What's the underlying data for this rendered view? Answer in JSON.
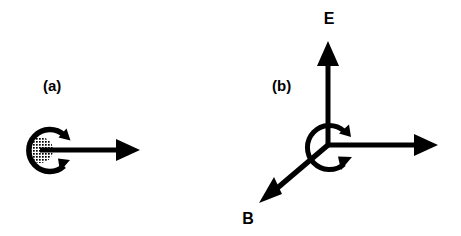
{
  "figure": {
    "background_color": "#ffffff",
    "stroke_color": "#000000",
    "width": 461,
    "height": 236
  },
  "panels": [
    {
      "id": "a",
      "label": "(a)",
      "label_x": 43,
      "label_y": 91,
      "description": "stippled sphere with spin rotation arrow and horizontal vector",
      "sphere": {
        "cx": 40,
        "cy": 150,
        "r": 13,
        "fill_pattern": "halftone-dots"
      },
      "rotation_arrow": {
        "cx": 48,
        "cy": 150,
        "r": 21,
        "opening": "right",
        "arrowheads": 2
      },
      "vector": {
        "label": "",
        "x1": 40,
        "y1": 150,
        "x2": 140,
        "y2": 150,
        "direction": "right"
      }
    },
    {
      "id": "b",
      "label": "(b)",
      "label_x": 272,
      "label_y": 91,
      "description": "three-axis vector triad with rotation arrow at origin",
      "origin_x": 328,
      "origin_y": 145,
      "rotation_arrow": {
        "cx": 322,
        "cy": 147,
        "r": 22,
        "opening": "right",
        "arrowheads": 2
      },
      "vectors": [
        {
          "label": "E",
          "label_x": 329,
          "label_y": 24,
          "x1": 328,
          "y1": 145,
          "x2": 328,
          "y2": 42,
          "direction": "up"
        },
        {
          "label": "",
          "label_x": 0,
          "label_y": 0,
          "x1": 328,
          "y1": 145,
          "x2": 437,
          "y2": 145,
          "direction": "right"
        },
        {
          "label": "B",
          "label_x": 248,
          "label_y": 224,
          "x1": 328,
          "y1": 145,
          "x2": 261,
          "y2": 201,
          "direction": "down-left"
        }
      ]
    }
  ]
}
